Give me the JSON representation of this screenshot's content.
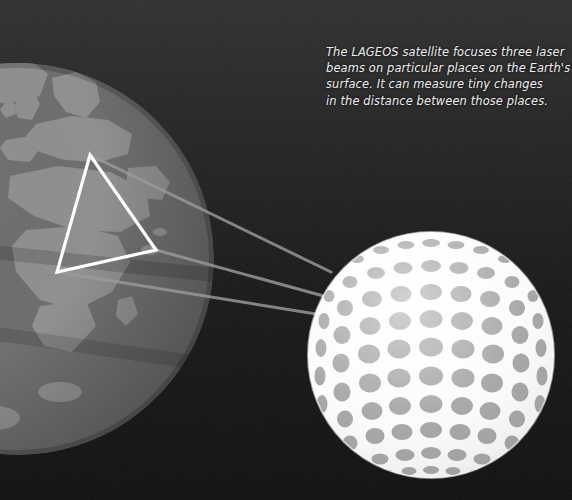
{
  "scene": {
    "title": "LAGEOS satellite laser ranging illustration",
    "width": 572,
    "height": 500,
    "background_color": "#161616",
    "background_top_color": "#2f2f2f"
  },
  "caption": {
    "full_text": "The LAGEOS satellite focuses three laser beams on particular places on the Earth's surface. It can measure tiny changes in the distance between those places.",
    "color": "#efefef",
    "lines": [
      "The LAGEOS satellite focuses three laser",
      "beams on particular places on the Earth's",
      "surface. It can measure tiny changes",
      "in the distance between those places."
    ]
  },
  "earth": {
    "label": "Earth globe",
    "center_x": 18,
    "center_y": 259,
    "radius": 196,
    "ocean_color": "#6e6e6e",
    "land_color": "#909090",
    "terminator_color": "#5f5f5f",
    "terminator_opacity": 0.35
  },
  "satellite": {
    "label": "LAGEOS satellite",
    "name": "LAGEOS",
    "center_x": 431,
    "center_y": 355,
    "radius": 123,
    "body_color": "#fdfdfd",
    "retroreflector_color": "#9d9d9d",
    "retroreflector_rings": [
      0,
      1,
      2,
      3,
      4,
      5,
      6,
      7,
      8
    ]
  },
  "triangle": {
    "label": "ground measurement triangle",
    "stroke_color": "#ffffff",
    "stroke_width": 3.2,
    "vertices": [
      {
        "name": "station-north",
        "x": 90,
        "y": 155
      },
      {
        "name": "station-east",
        "x": 156,
        "y": 250
      },
      {
        "name": "station-southwest",
        "x": 57,
        "y": 272
      }
    ]
  },
  "beams": {
    "label": "laser beams",
    "count": 3,
    "color": "#9a9a9a",
    "width": 3.0,
    "opacity": 0.8,
    "paths": [
      {
        "name": "beam-to-station-north",
        "x1": 331,
        "y1": 272,
        "x2": 90,
        "y2": 155
      },
      {
        "name": "beam-to-station-east",
        "x1": 338,
        "y1": 300,
        "x2": 156,
        "y2": 250
      },
      {
        "name": "beam-to-station-southwest",
        "x1": 341,
        "y1": 318,
        "x2": 57,
        "y2": 272
      }
    ]
  }
}
